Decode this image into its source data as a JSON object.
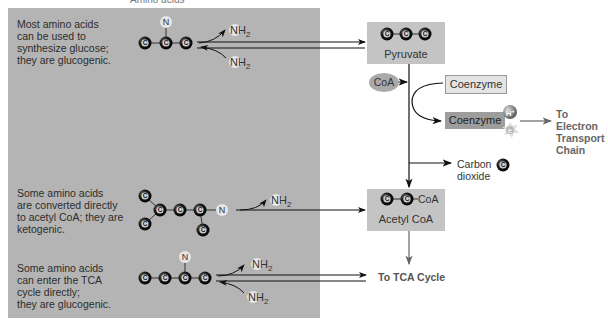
{
  "header": {
    "top_label": "Amino acids"
  },
  "panel": {
    "rows": [
      {
        "text": "Most amino acids\ncan be used to\nsynthesize glucose;\nthey are glucogenic.",
        "type": "glucogenic"
      },
      {
        "text": "Some amino acids\nare converted directly\nto acetyl CoA; they are\nketogenic.",
        "type": "ketogenic"
      },
      {
        "text": "Some amino acids\ncan enter the TCA\ncycle directly;\nthey are glucogenic.",
        "type": "glucogenic"
      }
    ]
  },
  "atoms": {
    "carbon": "C",
    "nitrogen": "N",
    "amine": "NH",
    "amine_sub": "2",
    "hydrogen_ion": "H+",
    "electron": "e-"
  },
  "pyruvate": {
    "label": "Pyruvate"
  },
  "coa": {
    "label": "CoA"
  },
  "coenzyme_oxidized": {
    "label": "Coenzyme"
  },
  "coenzyme_reduced": {
    "label": "Coenzyme"
  },
  "etc": {
    "label": "To Electron\nTransport\nChain"
  },
  "co2": {
    "label": "Carbon\ndioxide"
  },
  "acetyl_coa": {
    "label": "Acetyl CoA",
    "coa_tag": "CoA"
  },
  "tca": {
    "label": "To TCA Cycle"
  },
  "colors": {
    "panel": "#b4b4b4",
    "box": "#c4c4c4",
    "coenzyme_reduced": "#9d9d9d",
    "coenzyme_oxidized": "#e4e4e4",
    "carbon_atom": "#111111",
    "arrow": "#111111",
    "arrow_gray": "#666666"
  }
}
